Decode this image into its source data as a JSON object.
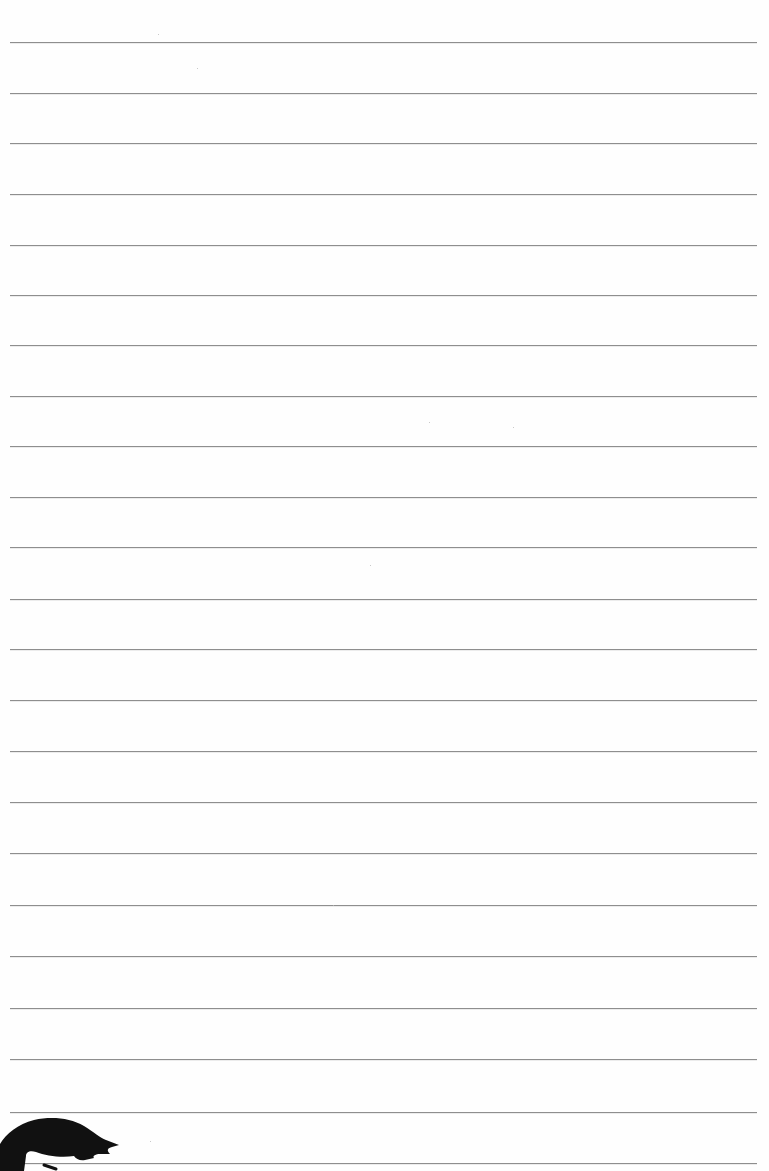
{
  "page": {
    "type": "lined-notebook-paper",
    "width": 769,
    "height": 1171,
    "background_color": "#fefefe",
    "rule_color": "#8e8e8e",
    "rule_left": 10,
    "rule_right": 757,
    "rule_count": 23,
    "rule_positions": [
      42,
      93,
      143,
      194,
      245,
      295,
      345,
      396,
      446,
      497,
      547,
      599,
      649,
      700,
      751,
      802,
      853,
      905,
      956,
      1008,
      1059,
      1112,
      1163
    ]
  },
  "decoration": {
    "icon": "cartoon-hair-silhouette-icon",
    "position": "bottom-left",
    "color": "#111111"
  }
}
